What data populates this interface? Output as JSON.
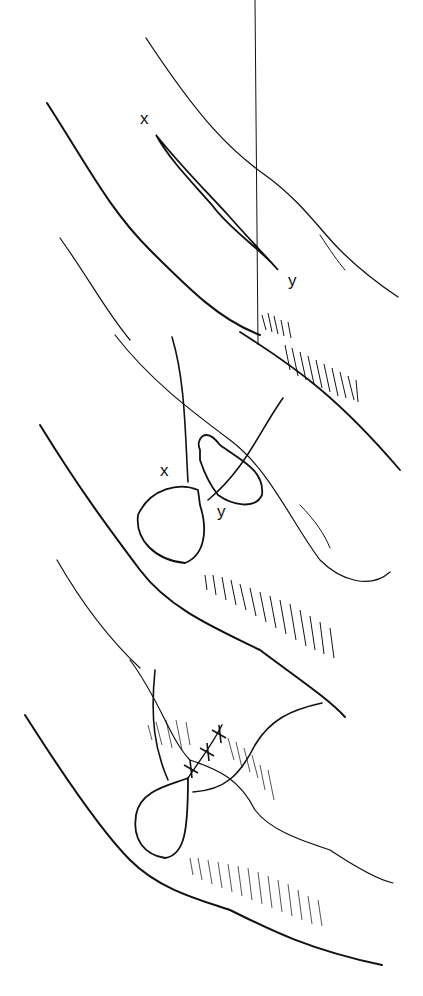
{
  "figure": {
    "panels": [
      {
        "id": "panel-1",
        "stage": "incision",
        "labels": {
          "point_a": "x",
          "point_b": "y"
        }
      },
      {
        "id": "panel-2",
        "stage": "edges drawn together",
        "labels": {
          "point_a": "x",
          "point_b": "y"
        }
      },
      {
        "id": "panel-3",
        "stage": "sutured closure",
        "sutures": 3
      }
    ],
    "colors": {
      "ink": "#111111",
      "background": "#ffffff"
    }
  }
}
